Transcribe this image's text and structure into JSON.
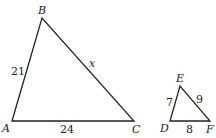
{
  "diagram": {
    "triangle_large": {
      "vertices": [
        {
          "name": "A",
          "x": 12,
          "y": 121
        },
        {
          "name": "B",
          "x": 42,
          "y": 18
        },
        {
          "name": "C",
          "x": 134,
          "y": 121
        }
      ],
      "sides": [
        {
          "between": "AB",
          "label": "21"
        },
        {
          "between": "BC",
          "label": "x"
        },
        {
          "between": "AC",
          "label": "24"
        }
      ]
    },
    "triangle_small": {
      "vertices": [
        {
          "name": "D",
          "x": 170,
          "y": 121
        },
        {
          "name": "E",
          "x": 180,
          "y": 86
        },
        {
          "name": "F",
          "x": 210,
          "y": 121
        }
      ],
      "sides": [
        {
          "between": "DE",
          "label": "7"
        },
        {
          "between": "EF",
          "label": "9"
        },
        {
          "between": "DF",
          "label": "8"
        }
      ]
    }
  },
  "labels": {
    "A": "A",
    "B": "B",
    "C": "C",
    "D": "D",
    "E": "E",
    "F": "F",
    "ab": "21",
    "bc": "x",
    "ac": "24",
    "de": "7",
    "ef": "9",
    "df": "8"
  }
}
